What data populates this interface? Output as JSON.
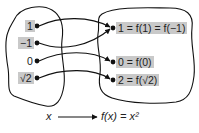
{
  "diagram": {
    "domain_set": {
      "elements": [
        "1",
        "−1",
        "0",
        "√2"
      ]
    },
    "codomain_set": {
      "elements": [
        "1 = f(1) = f(−1)",
        "0 = f(0)",
        "2 = f(√2)"
      ]
    },
    "mappings": [
      {
        "from": "1",
        "to": "1 = f(1) = f(−1)"
      },
      {
        "from": "−1",
        "to": "1 = f(1) = f(−1)"
      },
      {
        "from": "0",
        "to": "0 = f(0)"
      },
      {
        "from": "√2",
        "to": "2 = f(√2)"
      }
    ],
    "caption": {
      "left": "x",
      "right": "f(x) = x²"
    },
    "colors": {
      "highlight": "#c9c9c9",
      "line": "#111111"
    }
  }
}
